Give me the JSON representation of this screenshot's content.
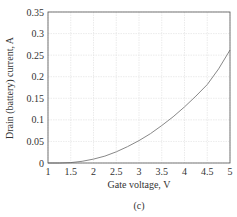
{
  "chart_data": {
    "type": "line",
    "title": "",
    "caption": "(c)",
    "xlabel": "Gate voltage, V",
    "ylabel": "Drain (battery) current, A",
    "xlim": [
      1,
      5
    ],
    "ylim": [
      0,
      0.35
    ],
    "grid": true,
    "xticks": [
      "1",
      "1.5",
      "2",
      "2.5",
      "3",
      "3.5",
      "4",
      "4.5",
      "5"
    ],
    "yticks": [
      "0",
      "0.05",
      "0.1",
      "0.15",
      "0.2",
      "0.25",
      "0.3",
      "0.35"
    ],
    "series": [
      {
        "name": "Drain current",
        "color": "#888888",
        "x": [
          1.0,
          1.25,
          1.5,
          1.75,
          2.0,
          2.25,
          2.5,
          2.75,
          3.0,
          3.25,
          3.5,
          3.75,
          4.0,
          4.25,
          4.5,
          4.75,
          5.0
        ],
        "y": [
          0.0,
          0.0,
          0.001,
          0.004,
          0.009,
          0.016,
          0.026,
          0.038,
          0.052,
          0.068,
          0.087,
          0.107,
          0.13,
          0.155,
          0.182,
          0.218,
          0.262
        ]
      }
    ]
  }
}
